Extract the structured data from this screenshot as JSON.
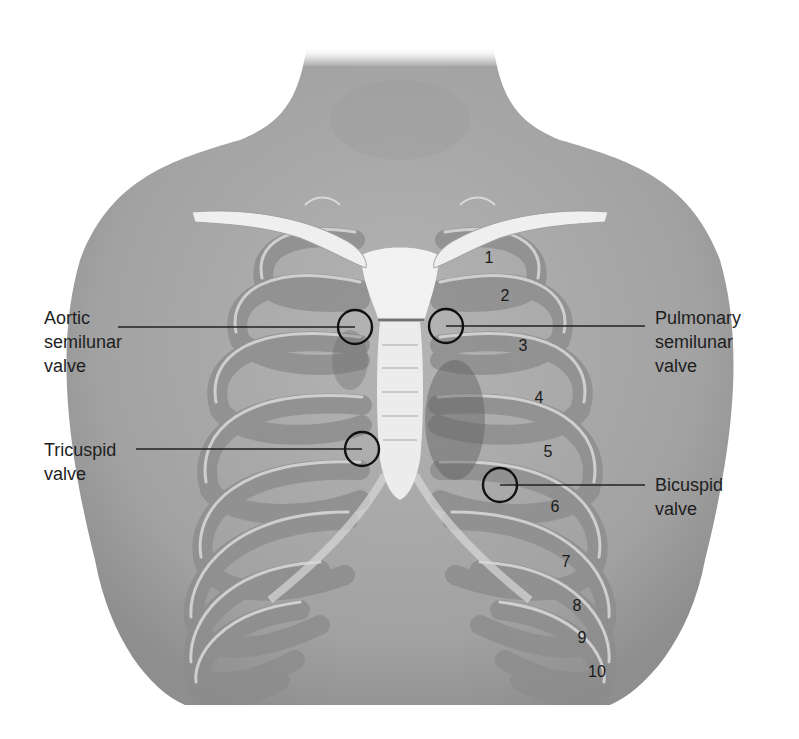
{
  "figure": {
    "colors": {
      "background": "#ffffff",
      "skin": "#a9a9a9",
      "skin_shadow": "#8a8a8a",
      "rib": "#bdbdbd",
      "rib_highlight": "#e6e6e6",
      "bone_white": "#f2f2f2",
      "circle_stroke": "#111111",
      "leader_line": "#222222",
      "text": "#1e1e1e"
    }
  },
  "valves": [
    {
      "id": "aortic",
      "lines": [
        "Aortic",
        "semilunar",
        "valve"
      ],
      "side": "left",
      "label_x": 44,
      "label_y": 306,
      "circle": {
        "cx": 355,
        "cy": 327,
        "r": 17
      },
      "line": {
        "x1": 118,
        "y1": 327,
        "x2": 355,
        "y2": 327
      }
    },
    {
      "id": "pulmonary",
      "lines": [
        "Pulmonary",
        "semilunar",
        "valve"
      ],
      "side": "right",
      "label_x": 655,
      "label_y": 306,
      "circle": {
        "cx": 446,
        "cy": 326,
        "r": 17
      },
      "line": {
        "x1": 446,
        "y1": 326,
        "x2": 645,
        "y2": 326
      }
    },
    {
      "id": "tricuspid",
      "lines": [
        "Tricuspid",
        "valve"
      ],
      "side": "left",
      "label_x": 44,
      "label_y": 438,
      "circle": {
        "cx": 362,
        "cy": 449,
        "r": 17
      },
      "line": {
        "x1": 136,
        "y1": 449,
        "x2": 362,
        "y2": 449
      }
    },
    {
      "id": "bicuspid",
      "lines": [
        "Bicuspid",
        "valve"
      ],
      "side": "right",
      "label_x": 655,
      "label_y": 473,
      "circle": {
        "cx": 500,
        "cy": 485,
        "r": 17
      },
      "line": {
        "x1": 500,
        "y1": 485,
        "x2": 645,
        "y2": 485
      }
    }
  ],
  "rib_numbers": [
    {
      "label": "1",
      "x": 489,
      "y": 258
    },
    {
      "label": "2",
      "x": 505,
      "y": 296
    },
    {
      "label": "3",
      "x": 523,
      "y": 346
    },
    {
      "label": "4",
      "x": 539,
      "y": 398
    },
    {
      "label": "5",
      "x": 548,
      "y": 452
    },
    {
      "label": "6",
      "x": 555,
      "y": 507
    },
    {
      "label": "7",
      "x": 566,
      "y": 562
    },
    {
      "label": "8",
      "x": 577,
      "y": 606
    },
    {
      "label": "9",
      "x": 582,
      "y": 638
    },
    {
      "label": "10",
      "x": 597,
      "y": 672
    }
  ]
}
